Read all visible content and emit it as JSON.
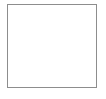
{
  "figure": {
    "kind": "range-map",
    "title": "Western United States distribution map",
    "description": "Outline map of the western United States enclosed in a thin rectangular border. A dark gray shaded band runs north to south along the eastern side of the map; a small dark patch appears in the far northwest corner.",
    "background_color": "#ffffff",
    "frame_color": "#8d8d8d",
    "border_color": "#8a8a8a",
    "coast_color": "#7a7a7a",
    "shade_color": "#6e6e6e",
    "shade_outline_color": "#3f3f3f",
    "shade_accent_color": "#3a3a3a"
  },
  "frame": {
    "label": "map-border",
    "x": 7,
    "y": 4,
    "width": 90,
    "height": 84
  },
  "regions": [
    {
      "id": "main-range-band",
      "label": "Shaded distribution band",
      "color": "#6e6e6e",
      "position": "eastern edge of map, running north to south",
      "extent_top_y": 25,
      "extent_bottom_y": 79
    },
    {
      "id": "northwest-patch",
      "label": "Shaded patch, northwest corner",
      "color": "#3a3a3a",
      "position": "far northwest, coastal",
      "extent_top_y": 9,
      "extent_bottom_y": 17
    }
  ],
  "legend": {
    "present": false,
    "items": []
  },
  "labels": {
    "present": false,
    "items": []
  },
  "axes": {
    "present": false
  }
}
